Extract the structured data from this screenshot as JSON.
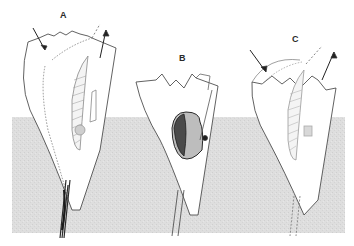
{
  "figure": {
    "panels": [
      {
        "id": "A",
        "label": "A",
        "x": 60,
        "y": 10
      },
      {
        "id": "B",
        "label": "B",
        "x": 179,
        "y": 53
      },
      {
        "id": "C",
        "label": "C",
        "x": 292,
        "y": 34
      }
    ],
    "colors": {
      "background": "#ffffff",
      "ground": "#dcdcdc",
      "ink": "#3a3a3a",
      "mass_dark": "#2b2b2b",
      "mass_light": "#bdbdbd"
    }
  }
}
